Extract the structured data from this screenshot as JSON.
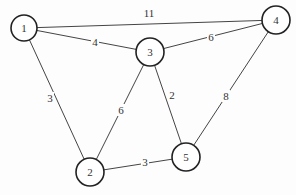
{
  "graph": {
    "title": "",
    "nodes": [
      {
        "id": "1",
        "label": "1",
        "x": 24,
        "y": 28,
        "r": 13
      },
      {
        "id": "2",
        "label": "2",
        "x": 90,
        "y": 172,
        "r": 14
      },
      {
        "id": "3",
        "label": "3",
        "x": 150,
        "y": 52,
        "r": 14
      },
      {
        "id": "4",
        "label": "4",
        "x": 276,
        "y": 20,
        "r": 14
      },
      {
        "id": "5",
        "label": "5",
        "x": 186,
        "y": 157,
        "r": 14
      }
    ],
    "edges": [
      {
        "from": "1",
        "to": "4",
        "weight": "11",
        "lx": 149,
        "ly": 13
      },
      {
        "from": "1",
        "to": "3",
        "weight": "4",
        "lx": 95,
        "ly": 42
      },
      {
        "from": "1",
        "to": "2",
        "weight": "3",
        "lx": 50,
        "ly": 98
      },
      {
        "from": "3",
        "to": "4",
        "weight": "6",
        "lx": 211,
        "ly": 37
      },
      {
        "from": "3",
        "to": "2",
        "weight": "6",
        "lx": 121,
        "ly": 110
      },
      {
        "from": "3",
        "to": "5",
        "weight": "2",
        "lx": 172,
        "ly": 95
      },
      {
        "from": "4",
        "to": "5",
        "weight": "8",
        "lx": 226,
        "ly": 96
      },
      {
        "from": "2",
        "to": "5",
        "weight": "3",
        "lx": 145,
        "ly": 162
      }
    ]
  }
}
